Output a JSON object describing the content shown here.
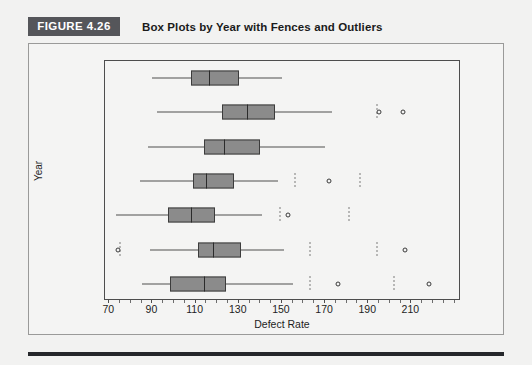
{
  "figure": {
    "badge": "FIGURE 4.26",
    "title": "Box Plots by Year with Fences and Outliers"
  },
  "chart_data": {
    "type": "boxplot",
    "title": "Box Plots by Year with Fences and Outliers",
    "xlabel": "Defect Rate",
    "ylabel": "Year",
    "xlim": [
      68,
      233
    ],
    "xticks": [
      70,
      90,
      110,
      130,
      150,
      170,
      190,
      210
    ],
    "xtick_labels": [
      "70",
      "90",
      "110",
      "130",
      "150",
      "170",
      "190",
      "210"
    ],
    "categories": [
      "2004",
      "2006",
      "2008",
      "2010",
      "2012",
      "2014",
      "2016"
    ],
    "grid": false,
    "legend": null,
    "series": [
      {
        "name": "2004",
        "whisker_low": 90,
        "q1": 108,
        "median": 116,
        "q3": 130,
        "whisker_high": 150,
        "fences": [],
        "outliers": []
      },
      {
        "name": "2006",
        "whisker_low": 92,
        "q1": 122,
        "median": 134,
        "q3": 147,
        "whisker_high": 173,
        "fences": [
          194
        ],
        "outliers": [
          195,
          206
        ]
      },
      {
        "name": "2008",
        "whisker_low": 88,
        "q1": 114,
        "median": 123,
        "q3": 140,
        "whisker_high": 170,
        "fences": [],
        "outliers": []
      },
      {
        "name": "2010",
        "whisker_low": 84,
        "q1": 109,
        "median": 115,
        "q3": 128,
        "whisker_high": 148,
        "fences": [
          156,
          186
        ],
        "outliers": [
          172
        ]
      },
      {
        "name": "2012",
        "whisker_low": 73,
        "q1": 97,
        "median": 108,
        "q3": 119,
        "whisker_high": 141,
        "fences": [
          149,
          181
        ],
        "outliers": [
          153
        ]
      },
      {
        "name": "2014",
        "whisker_low": 89,
        "q1": 111,
        "median": 118,
        "q3": 131,
        "whisker_high": 151,
        "fences": [
          75,
          163,
          194
        ],
        "outliers": [
          74,
          207
        ]
      },
      {
        "name": "2016",
        "whisker_low": 85,
        "q1": 98,
        "median": 114,
        "q3": 124,
        "whisker_high": 155,
        "fences": [
          163,
          202
        ],
        "outliers": [
          176,
          218
        ]
      }
    ]
  }
}
